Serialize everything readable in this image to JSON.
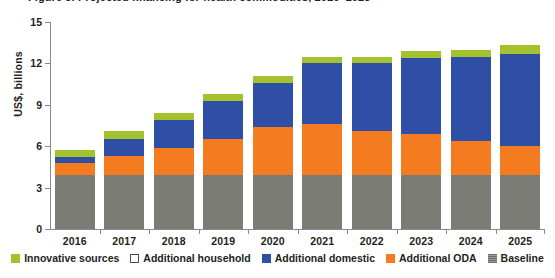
{
  "title_remnant": "Figure 3. Projected financing for health commodities, 2016–2025",
  "axis": {
    "ylabel": "US$, billions",
    "yticks": [
      0,
      3,
      6,
      9,
      12,
      15
    ],
    "ymin": 0,
    "ymax": 15
  },
  "legend": [
    {
      "label": "Innovative sources",
      "color": "#a4c22e",
      "style": "solid"
    },
    {
      "label": "Additional household",
      "color": "#ffffff",
      "style": "outline"
    },
    {
      "label": "Additional domestic",
      "color": "#2f4fa6",
      "style": "solid"
    },
    {
      "label": "Additional ODA",
      "color": "#f47b20",
      "style": "solid"
    },
    {
      "label": "Baseline",
      "color": "#7c7c76",
      "style": "striped"
    }
  ],
  "chart_data": {
    "type": "bar",
    "subtype": "stacked-bar",
    "title": "Projected financing for health commodities, 2016–2025",
    "xlabel": "",
    "ylabel": "US$, billions",
    "ylim": [
      0,
      15
    ],
    "yticks": [
      0,
      3,
      6,
      9,
      12,
      15
    ],
    "grid": false,
    "legend_position": "bottom",
    "categories": [
      "2016",
      "2017",
      "2018",
      "2019",
      "2020",
      "2021",
      "2022",
      "2023",
      "2024",
      "2025"
    ],
    "series": [
      {
        "name": "Baseline",
        "color": "#7c7c76",
        "values": [
          3.9,
          3.9,
          3.9,
          3.9,
          3.9,
          3.9,
          3.9,
          3.9,
          3.9,
          3.9
        ]
      },
      {
        "name": "Additional ODA",
        "color": "#f47b20",
        "values": [
          0.9,
          1.4,
          2.0,
          2.6,
          3.5,
          3.7,
          3.2,
          3.0,
          2.5,
          2.1
        ]
      },
      {
        "name": "Additional domestic",
        "color": "#2f4fa6",
        "values": [
          0.4,
          1.2,
          2.0,
          2.8,
          3.2,
          4.4,
          4.9,
          5.5,
          6.1,
          6.7
        ]
      },
      {
        "name": "Additional household",
        "color": "#ffffff",
        "values": [
          0.0,
          0.0,
          0.0,
          0.0,
          0.0,
          0.0,
          0.0,
          0.0,
          0.0,
          0.0
        ]
      },
      {
        "name": "Innovative sources",
        "color": "#a4c22e",
        "values": [
          0.5,
          0.6,
          0.5,
          0.5,
          0.5,
          0.5,
          0.5,
          0.5,
          0.5,
          0.6
        ]
      }
    ],
    "totals": [
      5.7,
      7.1,
      8.4,
      9.8,
      11.1,
      12.5,
      12.5,
      12.9,
      13.0,
      13.3
    ]
  }
}
